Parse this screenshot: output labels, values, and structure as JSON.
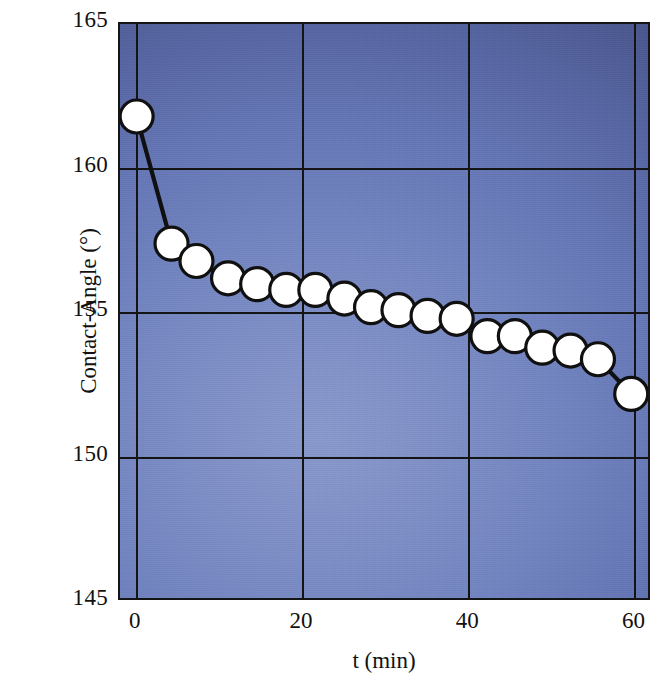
{
  "chart_data": {
    "type": "line",
    "title": "",
    "xlabel": "t (min)",
    "ylabel": "Contact-Angle (°)",
    "xlim": [
      -2,
      62
    ],
    "ylim": [
      145,
      165
    ],
    "xticks": [
      0,
      20,
      40,
      60
    ],
    "yticks": [
      145,
      150,
      155,
      160,
      165
    ],
    "xtick_labels": [
      "0",
      "20",
      "40",
      "60"
    ],
    "ytick_labels": [
      "145",
      "150",
      "155",
      "160",
      "165"
    ],
    "grid": true,
    "legend": "none",
    "marker": "filled-white-circle",
    "marker_edge_color": "#101010",
    "marker_face_color": "#ffffff",
    "line_color": "#101010",
    "plot_background": "blue-radial-gradient",
    "series": [
      {
        "name": "Contact angle",
        "x": [
          0,
          4.2,
          7.2,
          11.0,
          14.5,
          18.0,
          21.5,
          25.0,
          28.2,
          31.5,
          35.0,
          38.5,
          42.2,
          45.5,
          48.8,
          52.2,
          55.5,
          59.5
        ],
        "y": [
          161.8,
          157.4,
          156.8,
          156.2,
          156.0,
          155.8,
          155.8,
          155.5,
          155.2,
          155.1,
          154.9,
          154.8,
          154.2,
          154.2,
          153.8,
          153.7,
          153.4,
          152.2
        ]
      }
    ],
    "points": [
      {
        "t": 0,
        "angle": 161.8
      },
      {
        "t": 4.2,
        "angle": 157.4
      },
      {
        "t": 7.2,
        "angle": 156.8
      },
      {
        "t": 11.0,
        "angle": 156.2
      },
      {
        "t": 14.5,
        "angle": 156.0
      },
      {
        "t": 18.0,
        "angle": 155.8
      },
      {
        "t": 21.5,
        "angle": 155.8
      },
      {
        "t": 25.0,
        "angle": 155.5
      },
      {
        "t": 28.2,
        "angle": 155.2
      },
      {
        "t": 31.5,
        "angle": 155.1
      },
      {
        "t": 35.0,
        "angle": 154.9
      },
      {
        "t": 38.5,
        "angle": 154.8
      },
      {
        "t": 42.2,
        "angle": 154.2
      },
      {
        "t": 45.5,
        "angle": 154.2
      },
      {
        "t": 48.8,
        "angle": 153.8
      },
      {
        "t": 52.2,
        "angle": 153.7
      },
      {
        "t": 55.5,
        "angle": 153.4
      },
      {
        "t": 59.5,
        "angle": 152.2
      }
    ]
  },
  "axes": {
    "y_title": "Contact-Angle (°)",
    "x_title": "t (min)",
    "y_labels": [
      "165",
      "160",
      "155",
      "150",
      "145"
    ],
    "x_labels": [
      "0",
      "20",
      "40",
      "60"
    ]
  }
}
